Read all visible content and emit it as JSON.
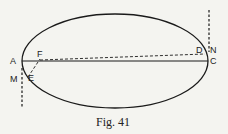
{
  "figure": {
    "caption": "Fig. 41",
    "labels": {
      "A": "A",
      "F": "F",
      "M": "M",
      "E": "E",
      "D": "D",
      "N": "N",
      "C": "C"
    },
    "colors": {
      "ink": "#1a1a1a",
      "background": "#f4f4f0"
    }
  }
}
